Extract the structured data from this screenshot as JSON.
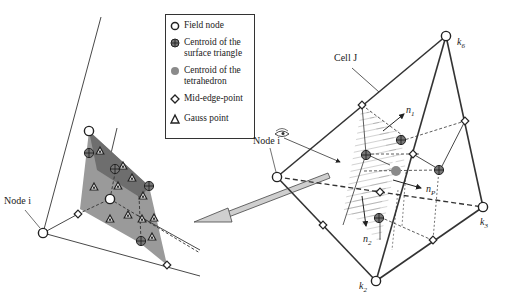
{
  "legend": {
    "items": [
      {
        "symbol": "open-circle",
        "label": "Field node"
      },
      {
        "symbol": "crossed-circle",
        "label": "Centroid of the\nsurface triangle"
      },
      {
        "symbol": "gray-dot",
        "label": "Centroid of the\ntetrahedron"
      },
      {
        "symbol": "diamond",
        "label": "Mid-edge-point"
      },
      {
        "symbol": "triangle",
        "label": "Gauss point"
      }
    ]
  },
  "labels": {
    "left_node": "Node i",
    "right_node": "Node i",
    "cell": "Cell J",
    "k6": "k",
    "k6_sub": "6",
    "k2": "k",
    "k2_sub": "2",
    "k3": "k",
    "k3_sub": "3",
    "n1": "n",
    "n1_sub": "1",
    "n2": "n",
    "n2_sub": "2",
    "np": "n",
    "np_sub": "P"
  },
  "colors": {
    "line": "#333333",
    "shade_light": "#9a9a9a",
    "shade_dark": "#6e6e6e",
    "tet_centroid": "#8a8a8a",
    "arrow_fill": "#c8c8c8"
  }
}
